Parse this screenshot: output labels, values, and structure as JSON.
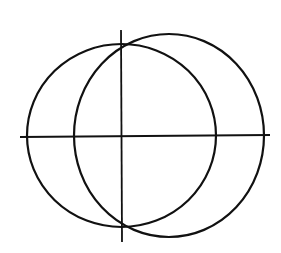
{
  "diagram": {
    "width": 281,
    "height": 253,
    "stroke_color": "#111111",
    "background": "#ffffff",
    "horizontal_axis": {
      "x1": 20,
      "y1": 137,
      "x2": 270,
      "y2": 135
    },
    "vertical_axis": {
      "x1": 121,
      "y1": 30,
      "x2": 122,
      "y2": 242
    },
    "ellipses": [
      {
        "name": "left-ellipse",
        "cx": 121.5,
        "cy": 135.5,
        "rx": 94.5,
        "ry": 91.5
      },
      {
        "name": "right-ellipse",
        "cx": 169,
        "cy": 135.5,
        "rx": 95,
        "ry": 101.5
      }
    ]
  }
}
